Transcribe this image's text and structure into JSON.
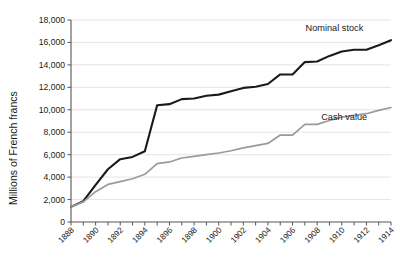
{
  "chart_data": {
    "type": "line",
    "title": "",
    "subtitle": "",
    "xlabel": "",
    "ylabel": "Millions of French francs",
    "xlim": [
      1888,
      1914
    ],
    "ylim": [
      0,
      18000
    ],
    "grid": "horizontal",
    "legend_position": "inline-right",
    "y_ticks": [
      0,
      2000,
      4000,
      6000,
      8000,
      10000,
      12000,
      14000,
      16000,
      18000
    ],
    "y_tick_labels": [
      "0",
      "2,000",
      "4,000",
      "6,000",
      "8,000",
      "10,000",
      "12,000",
      "14,000",
      "16,000",
      "18,000"
    ],
    "x_ticks": [
      1888,
      1889,
      1890,
      1891,
      1892,
      1893,
      1894,
      1895,
      1896,
      1897,
      1898,
      1899,
      1900,
      1901,
      1902,
      1903,
      1904,
      1905,
      1906,
      1907,
      1908,
      1909,
      1910,
      1911,
      1912,
      1913,
      1914
    ],
    "x_tick_labels_shown": [
      "1888",
      "1890",
      "1892",
      "1894",
      "1896",
      "1898",
      "1900",
      "1902",
      "1904",
      "1906",
      "1908",
      "1910",
      "1912",
      "1914"
    ],
    "x": [
      1888,
      1889,
      1890,
      1891,
      1892,
      1893,
      1894,
      1895,
      1896,
      1897,
      1898,
      1899,
      1900,
      1901,
      1902,
      1903,
      1904,
      1905,
      1906,
      1907,
      1908,
      1909,
      1910,
      1911,
      1912,
      1913,
      1914
    ],
    "series": [
      {
        "name": "Nominal stock",
        "color": "#1a1a1a",
        "line_width": 2.1,
        "label_x": 1909.4,
        "label_y": 17050,
        "values": [
          1350,
          1850,
          3300,
          4700,
          5600,
          5800,
          6300,
          10400,
          10500,
          10950,
          11000,
          11250,
          11350,
          11650,
          11950,
          12050,
          12300,
          13150,
          13150,
          14250,
          14300,
          14800,
          15200,
          15350,
          15350,
          15750,
          16200
        ]
      },
      {
        "name": "Cash value",
        "color": "#9a9a9a",
        "line_width": 1.7,
        "label_x": 1910.2,
        "label_y": 9050,
        "values": [
          1350,
          1800,
          2700,
          3350,
          3600,
          3850,
          4250,
          5200,
          5350,
          5700,
          5850,
          6000,
          6150,
          6350,
          6600,
          6800,
          7000,
          7750,
          7750,
          8700,
          8700,
          9050,
          9350,
          9500,
          9650,
          9950,
          10200
        ]
      }
    ]
  }
}
